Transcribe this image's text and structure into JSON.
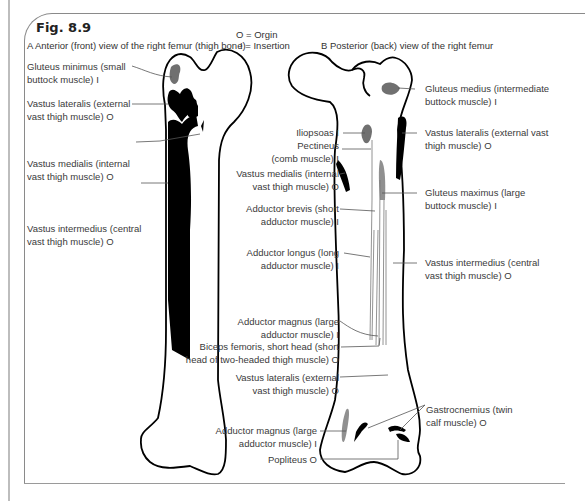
{
  "figure": {
    "title": "Fig. 8.9",
    "panel_a_title": "A Anterior (front) view of the right femur (thigh bone)",
    "panel_b_title": "B Posterior (back) view of the right femur",
    "legend": {
      "origin": "O = Orgin",
      "insertion": "I = Insertion"
    }
  },
  "anterior_labels": [
    {
      "line1": "Gluteus minimus (small",
      "line2": "buttock muscle) I"
    },
    {
      "line1": "Vastus lateralis (external",
      "line2": "vast thigh muscle) O"
    },
    {
      "line1": "Vastus medialis (internal",
      "line2": "vast thigh muscle) O"
    },
    {
      "line1": "Vastus intermedius (central",
      "line2": "vast thigh muscle) O"
    }
  ],
  "posterior_left_labels": [
    {
      "line1": "Iliopsoas I",
      "line2": ""
    },
    {
      "line1": "Pectineus",
      "line2": "(comb muscle) I"
    },
    {
      "line1": "Vastus medialis (internal",
      "line2": "vast thigh muscle) O"
    },
    {
      "line1": "Adductor brevis (short",
      "line2": "adductor muscle) I"
    },
    {
      "line1": "Adductor longus (long",
      "line2": "adductor muscle) I"
    },
    {
      "line1": "Adductor magnus (large",
      "line2": "adductor muscle) I"
    },
    {
      "line1": "Biceps femoris, short head (short",
      "line2": "head of two-headed thigh muscle) O"
    },
    {
      "line1": "Vastus lateralis (external",
      "line2": "vast thigh muscle) O"
    },
    {
      "line1": "Adductor magnus (large",
      "line2": "adductor muscle) I"
    },
    {
      "line1": "Popliteus O",
      "line2": ""
    }
  ],
  "posterior_right_labels": [
    {
      "line1": "Gluteus medius (intermediate",
      "line2": "buttock muscle) I"
    },
    {
      "line1": "Vastus lateralis (external vast",
      "line2": "thigh muscle) O"
    },
    {
      "line1": "Gluteus maximus (large",
      "line2": "buttock muscle) I"
    },
    {
      "line1": "Vastus intermedius (central",
      "line2": "vast thigh muscle) O"
    },
    {
      "line1": "Gastrocnemius (twin",
      "line2": "calf muscle) O"
    }
  ],
  "colors": {
    "origin_fill": "#000000",
    "insertion_fill": "#707070",
    "outline": "#000000",
    "label_text": "#3a3a3a"
  }
}
